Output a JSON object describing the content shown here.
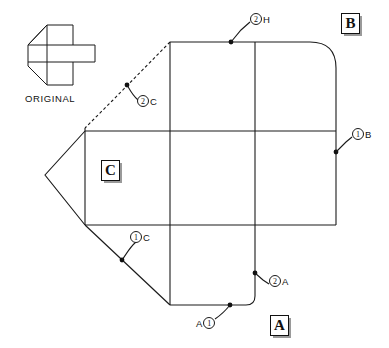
{
  "diagram": {
    "title_visible": false,
    "original_label": "ORIGINAL",
    "face_labels": {
      "a": "A",
      "b": "B",
      "c": "C"
    },
    "callouts": [
      {
        "id": "callout-2h",
        "number": "2",
        "letter": "H",
        "x": 250,
        "y": 13
      },
      {
        "id": "callout-2c",
        "number": "2",
        "letter": "C",
        "x": 137,
        "y": 95
      },
      {
        "id": "callout-1b",
        "number": "1",
        "letter": "B",
        "x": 352,
        "y": 128
      },
      {
        "id": "callout-1c",
        "number": "1",
        "letter": "C",
        "x": 130,
        "y": 230
      },
      {
        "id": "callout-2a",
        "number": "2",
        "letter": "A",
        "x": 269,
        "y": 274
      },
      {
        "id": "callout-a1",
        "number": "1",
        "letter": "A",
        "letter_first": true,
        "x": 197,
        "y": 316
      }
    ],
    "colors": {
      "line": "#1a1a1a",
      "background": "#ffffff",
      "marker": "#111111",
      "shadow": "#9a9a9a"
    },
    "geometry": {
      "apex": [
        45,
        175
      ],
      "grid_x": [
        170,
        255,
        336
      ],
      "grid_y": [
        42,
        131,
        225,
        305
      ]
    }
  }
}
